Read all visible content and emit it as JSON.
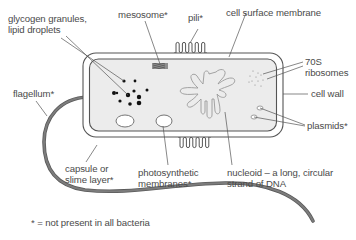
{
  "diagram": {
    "colors": {
      "background": "#ffffff",
      "cytoplasm": "#ececec",
      "outline": "#555555",
      "flagellum": "#6e6e6e",
      "granules": "#111111",
      "text": "#4a4a4a"
    },
    "labels": {
      "glycogen": [
        "glycogen granules,",
        "lipid droplets"
      ],
      "mesosome": "mesosome*",
      "pili": "pili*",
      "cell_surface_membrane": "cell surface membrane",
      "ribosomes": [
        "70S",
        "ribosomes"
      ],
      "flagellum": "flagellum*",
      "cell_wall": "cell wall",
      "plasmids": "plasmids*",
      "capsule": [
        "capsule or",
        "slime layer*"
      ],
      "photosynthetic": [
        "photosynthetic",
        "membranes*"
      ],
      "nucleoid": [
        "nucleoid – a long, circular",
        "strand of DNA"
      ]
    },
    "footnote": "* = not present in all bacteria"
  }
}
